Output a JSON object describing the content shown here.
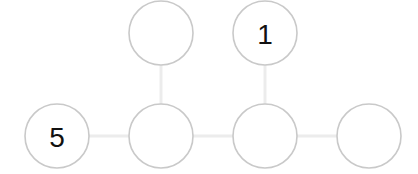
{
  "puzzle": {
    "nodes": [
      {
        "id": "top-1",
        "cx": 161,
        "cy": 33,
        "value": ""
      },
      {
        "id": "top-2",
        "cx": 265,
        "cy": 33,
        "value": "1"
      },
      {
        "id": "bottom-1",
        "cx": 57,
        "cy": 136,
        "value": "5"
      },
      {
        "id": "bottom-2",
        "cx": 161,
        "cy": 136,
        "value": ""
      },
      {
        "id": "bottom-3",
        "cx": 265,
        "cy": 136,
        "value": ""
      },
      {
        "id": "bottom-4",
        "cx": 369,
        "cy": 136,
        "value": ""
      }
    ],
    "edges": [
      [
        "top-1",
        "bottom-2"
      ],
      [
        "top-2",
        "bottom-3"
      ],
      [
        "bottom-1",
        "bottom-2"
      ],
      [
        "bottom-2",
        "bottom-3"
      ],
      [
        "bottom-3",
        "bottom-4"
      ]
    ],
    "radius": 32,
    "colors": {
      "node_stroke": "#c9c9c9",
      "edge": "#ececec",
      "text": "#111111"
    }
  }
}
